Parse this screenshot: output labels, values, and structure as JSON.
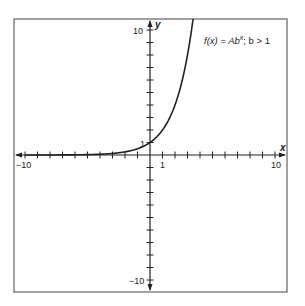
{
  "chart_data": {
    "type": "line",
    "title": "",
    "annotation": "f(x) = Ab^x; b > 1",
    "annotation_parts": {
      "f": "f(x) = Ab",
      "sup": "x",
      "rest": "; b > 1"
    },
    "xlabel": "x",
    "ylabel": "y",
    "xlim": [
      -10,
      10
    ],
    "ylim": [
      -10,
      10
    ],
    "x_tick_labels": [
      "-10",
      "1",
      "10"
    ],
    "y_tick_labels": [
      "10",
      "1",
      "-10"
    ],
    "x_tick_labels_display": {
      "neg10": "−10",
      "one": "1",
      "ten": "10"
    },
    "y_tick_labels_display": {
      "ten": "10",
      "one": "1",
      "neg10": "−10"
    },
    "grid": false,
    "legend": null,
    "series": [
      {
        "name": "f(x) = Ab^x",
        "description": "exponential growth, A = 1, b = 2",
        "x": [
          -10,
          -8,
          -6,
          -4,
          -3,
          -2,
          -1,
          0,
          1,
          2,
          3,
          3.5
        ],
        "values": [
          0.001,
          0.004,
          0.016,
          0.0625,
          0.125,
          0.25,
          0.5,
          1,
          2,
          4,
          8,
          11.3
        ]
      }
    ]
  }
}
